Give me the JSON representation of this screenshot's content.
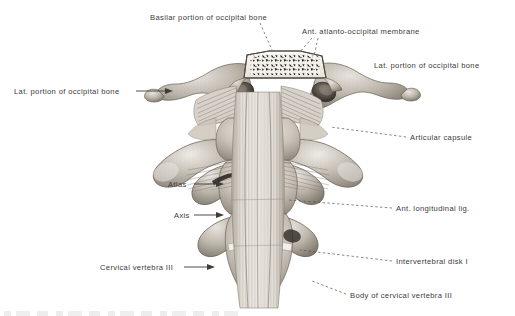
{
  "figure": {
    "type": "anatomical-illustration",
    "rendering": "grayscale halftone engraving",
    "background_color": "#ffffff",
    "label_color": "#3b3b3b",
    "bone_light": "#e2ded8",
    "bone_mid": "#b3aca3",
    "bone_dark": "#6d665d",
    "ligament_color": "#ded9d1"
  },
  "labels": [
    {
      "id": "basilar-portion-of-occipital-bone",
      "text": "Basilar portion of occipital bone",
      "x": 150,
      "y": 14,
      "leader": "dashed"
    },
    {
      "id": "ant-atlanto-occipital-membrane",
      "text": "Ant. atlanto-occipital membrane",
      "x": 302,
      "y": 28,
      "leader": "dashed-forked"
    },
    {
      "id": "lat-portion-of-occipital-bone-right",
      "text": "Lat. portion of occipital bone",
      "x": 374,
      "y": 62,
      "leader": "none"
    },
    {
      "id": "lat-portion-of-occipital-bone-left",
      "text": "Lat. portion of occipital bone",
      "x": 14,
      "y": 88,
      "leader": "arrow"
    },
    {
      "id": "articular-capsule",
      "text": "Articular capsule",
      "x": 410,
      "y": 134,
      "leader": "dashed"
    },
    {
      "id": "atlas",
      "text": "Atlas",
      "x": 168,
      "y": 181,
      "leader": "arrow"
    },
    {
      "id": "ant-longitudinal-lig",
      "text": "Ant. longitudinal lig.",
      "x": 396,
      "y": 205,
      "leader": "dashed"
    },
    {
      "id": "axis",
      "text": "Axis",
      "x": 174,
      "y": 212,
      "leader": "arrow"
    },
    {
      "id": "intervertebral-disk-i",
      "text": "Intervertebral disk I",
      "x": 396,
      "y": 258,
      "leader": "dashed"
    },
    {
      "id": "cervical-vertebra-iii",
      "text": "Cervical vertebra III",
      "x": 100,
      "y": 264,
      "leader": "arrow"
    },
    {
      "id": "body-of-cervical-vertebra-iii",
      "text": "Body of cervical vertebra III",
      "x": 350,
      "y": 292,
      "leader": "dashed"
    }
  ]
}
